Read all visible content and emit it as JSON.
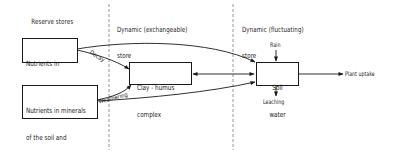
{
  "diagram": {
    "columns": [
      {
        "label_line1": "Reserve stores",
        "label_line2": ""
      },
      {
        "label_line1": "Dynamic (exchangeable)",
        "label_line2": "store"
      },
      {
        "label_line1": "Dynamic (fluctuating)",
        "label_line2": "store"
      }
    ],
    "nodes": {
      "plant_tissue": {
        "line1": "Nutrients in",
        "line2": "plant tissue"
      },
      "minerals": {
        "line1": "Nutrients in minerals",
        "line2": "of the soil and",
        "line3": "parent material"
      },
      "clay_humus": {
        "line1": "Clay - humus",
        "line2": "complex"
      },
      "soil_water": {
        "line1": "Soil",
        "line2": "water"
      }
    },
    "edge_labels": {
      "decay": "Decay",
      "weathering": "Weathering",
      "rain": "Rain",
      "leaching": "Leaching",
      "plant_uptake": "Plant uptake"
    },
    "colors": {
      "line": "#1a1a1a",
      "divider": "#9a9a9a",
      "background": "#ffffff"
    }
  }
}
